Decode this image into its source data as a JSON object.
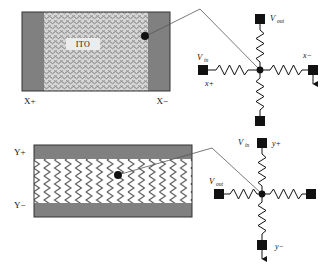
{
  "figure": {
    "colors": {
      "electrode_bar": "#808080",
      "ito_fill": "#c8c8c8",
      "panel_stroke": "#333333",
      "wire": "#111111",
      "leader": "#555555",
      "background": "#ffffff"
    }
  },
  "top_panel": {
    "name": "x-layer-panel",
    "ito_label": "ITO",
    "left_electrode_label": "X+",
    "right_electrode_label": "X−",
    "touch_point_label": "touch-point"
  },
  "top_circuit": {
    "name": "x-layer-circuit",
    "v_out": {
      "v": "V",
      "sub": "out"
    },
    "v_in": {
      "v": "V",
      "sub": "in"
    },
    "axis_positive": "x+",
    "axis_negative": "x−"
  },
  "bottom_panel": {
    "name": "y-layer-panel",
    "top_electrode_label": "Y+",
    "bottom_electrode_label": "Y−",
    "touch_point_label": "touch-point"
  },
  "bottom_circuit": {
    "name": "y-layer-circuit",
    "v_in": {
      "v": "V",
      "sub": "in"
    },
    "v_out": {
      "v": "V",
      "sub": "out"
    },
    "axis_positive": "y+",
    "axis_negative": "y−"
  }
}
